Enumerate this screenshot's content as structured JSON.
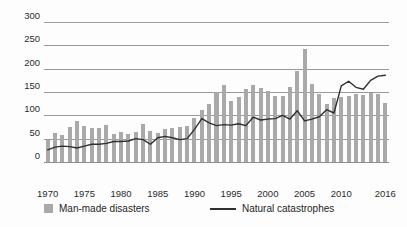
{
  "chart_data": {
    "type": "bar",
    "title": "",
    "subtitle": "",
    "xlabel": "",
    "ylabel": "",
    "ylim": [
      0,
      300
    ],
    "yticks": [
      0,
      50,
      100,
      150,
      200,
      250,
      300
    ],
    "ytick_labels": [
      "0",
      "50",
      "100",
      "150",
      "200",
      "250",
      "300"
    ],
    "xticks": [
      1970,
      1975,
      1980,
      1985,
      1990,
      1995,
      2000,
      2005,
      2010,
      2016
    ],
    "xtick_labels": [
      "1970",
      "1975",
      "1980",
      "1985",
      "1990",
      "1995",
      "2000",
      "2005",
      "2010",
      "2016"
    ],
    "grid": true,
    "legend_position": "bottom",
    "x": [
      1970,
      1971,
      1972,
      1973,
      1974,
      1975,
      1976,
      1977,
      1978,
      1979,
      1980,
      1981,
      1982,
      1983,
      1984,
      1985,
      1986,
      1987,
      1988,
      1989,
      1990,
      1991,
      1992,
      1993,
      1994,
      1995,
      1996,
      1997,
      1998,
      1999,
      2000,
      2001,
      2002,
      2003,
      2004,
      2005,
      2006,
      2007,
      2008,
      2009,
      2010,
      2011,
      2012,
      2013,
      2014,
      2015,
      2016
    ],
    "series": [
      {
        "name": "Man-made disasters",
        "render": "bar",
        "color": "#a9a9a9",
        "values": [
          47,
          62,
          58,
          75,
          88,
          78,
          73,
          72,
          80,
          60,
          65,
          60,
          65,
          82,
          66,
          62,
          70,
          73,
          74,
          78,
          95,
          112,
          124,
          150,
          165,
          130,
          140,
          157,
          165,
          158,
          152,
          141,
          141,
          160,
          196,
          243,
          167,
          145,
          124,
          138,
          139,
          141,
          146,
          143,
          147,
          145,
          126
        ]
      },
      {
        "name": "Natural catastrophes",
        "render": "line",
        "color": "#2f2f2f",
        "values": [
          26,
          32,
          34,
          33,
          30,
          34,
          38,
          38,
          40,
          44,
          44,
          45,
          50,
          48,
          38,
          52,
          55,
          52,
          48,
          50,
          70,
          93,
          84,
          78,
          80,
          79,
          82,
          78,
          96,
          90,
          92,
          93,
          100,
          92,
          110,
          88,
          92,
          97,
          112,
          105,
          163,
          173,
          160,
          156,
          175,
          184,
          186
        ]
      }
    ]
  },
  "legend": {
    "items": [
      {
        "label": "Man-made disasters",
        "marker": "bar-swatch"
      },
      {
        "label": "Natural catastrophes",
        "marker": "line-swatch"
      }
    ]
  }
}
